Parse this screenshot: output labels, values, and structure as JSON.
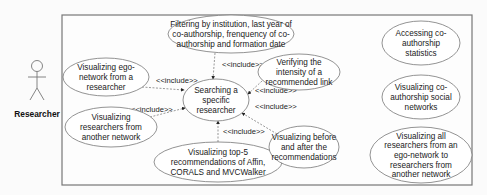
{
  "diagram": {
    "type": "uml-use-case",
    "actor": {
      "name": "Researcher",
      "icon": "stick-figure-icon"
    },
    "central_use_case": {
      "id": "search",
      "lines": [
        "Searching a",
        "specific",
        "researcher"
      ]
    },
    "use_cases": [
      {
        "id": "filter",
        "lines": [
          "Filtering by institution, last year of",
          "co-authorship, frenquency of co-",
          "authorship and formation date"
        ]
      },
      {
        "id": "ego",
        "lines": [
          "Visualizing ego-",
          "network from a",
          "researcher"
        ]
      },
      {
        "id": "verify",
        "lines": [
          "Verifying the",
          "intensity of a",
          "recommended link"
        ]
      },
      {
        "id": "other",
        "lines": [
          "Visualizing",
          "researchers from",
          "another network"
        ]
      },
      {
        "id": "top5",
        "lines": [
          "Visualizing top-5",
          "recommendations of Affin,",
          "CORALS and MVCWalker"
        ]
      },
      {
        "id": "before",
        "lines": [
          "Visualizing before",
          "and after the",
          "recommendations"
        ]
      },
      {
        "id": "stats",
        "lines": [
          "Accessing co-",
          "authorship",
          "statistics"
        ]
      },
      {
        "id": "social",
        "lines": [
          "Visualizing co-",
          "authorship social",
          "networks"
        ]
      },
      {
        "id": "all",
        "lines": [
          "Visualizing all",
          "researchers from an",
          "ego-network to",
          "researchers from",
          "another network"
        ]
      }
    ],
    "include_label": "<<include>>",
    "include_relations": [
      "filter",
      "ego",
      "verify",
      "other",
      "top5",
      "before"
    ],
    "colors": {
      "line": "#555555",
      "text": "#1a1a1a",
      "fill": "#ffffff",
      "border": "#777777"
    }
  }
}
